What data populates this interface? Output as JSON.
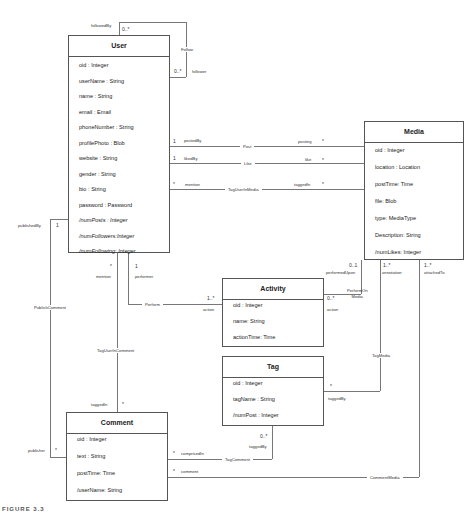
{
  "classes": {
    "user": {
      "name": "User",
      "attributes": [
        "oid : Integer",
        "userName : String",
        "name : String",
        "email : Email",
        "phoneNumber : String",
        "profilePhoto : Blob",
        "website : String",
        "gender : String",
        "bio : String",
        "password : Password",
        "/numPosts : Integer",
        "/numFollowers:Integer",
        "/numFollowing: Integer"
      ]
    },
    "media": {
      "name": "Media",
      "attributes": [
        "oid : Integer",
        "location : Location",
        "postTime: Time",
        "file: Blob",
        "type: MediaType",
        "Description: String",
        "/numLikes: Integer"
      ]
    },
    "activity": {
      "name": "Activity",
      "attributes": [
        "oid : Integer",
        "name: String",
        "actionTime: Time"
      ]
    },
    "tag": {
      "name": "Tag",
      "attributes": [
        "oid : Integer",
        "tagName : String",
        "/numPost : Integer"
      ]
    },
    "comment": {
      "name": "Comment",
      "attributes": [
        "oid : Integer",
        "text : String",
        "postTime: Time",
        "/userName: String"
      ]
    }
  },
  "associations": {
    "follow": {
      "name": "Follow",
      "role_a": "followedBy",
      "mult_a": "0..*",
      "role_b": "follower",
      "mult_b": "0..*"
    },
    "post": {
      "name": "Post",
      "role_a": "postedBy",
      "mult_a": "1",
      "role_b": "posting",
      "mult_b": "*"
    },
    "like": {
      "name": "Like",
      "role_a": "likedBy",
      "mult_a": "1",
      "role_b": "like",
      "mult_b": "*"
    },
    "tag_user_in_media": {
      "name": "TagUserInMedia",
      "role_a": "mention",
      "mult_a": "*",
      "role_b": "taggedIn",
      "mult_b": "*"
    },
    "perform": {
      "name": "Perform",
      "role_a": "performer",
      "mult_a": "1",
      "role_b": "action",
      "mult_b": "1..*"
    },
    "perform_on_media": {
      "name": "PerformOn\nMedia",
      "role_a": "action",
      "mult_a": "0..*",
      "role_b": "performedUpon",
      "mult_b": "0..1"
    },
    "tag_media": {
      "name": "TagMedia",
      "role_a": "annotation",
      "mult_a": "1..*",
      "role_b": "taggedBy",
      "mult_b": "*"
    },
    "comment_media": {
      "name": "CommentMedia",
      "role_a": "attachedTo",
      "mult_a": "1..*",
      "role_b": "comment",
      "mult_b": "*"
    },
    "publish_comment": {
      "name": "PublishComment",
      "role_a": "publishedBy",
      "mult_a": "1",
      "role_b": "publisher",
      "mult_b": "*"
    },
    "tag_user_in_comment": {
      "name": "TagUserInComment",
      "role_a": "mention",
      "mult_a": "*",
      "role_b": "taggedIn",
      "mult_b": "*"
    },
    "tag_comment": {
      "name": "TagComment",
      "role_a": "taggedBy",
      "mult_a": "0..*",
      "role_b": "comprisedIn",
      "mult_b": "*"
    }
  },
  "caption": "FIGURE 3.3"
}
